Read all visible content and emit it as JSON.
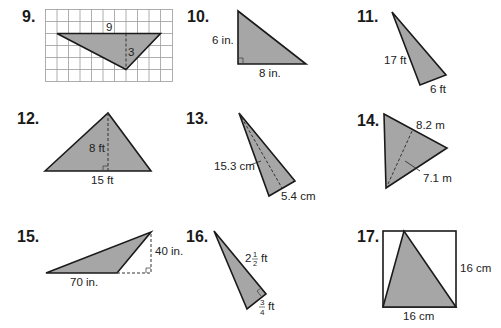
{
  "problems": [
    {
      "number": "9.",
      "labels": {
        "base": "9",
        "height": "3"
      },
      "figure": "triangle-on-grid"
    },
    {
      "number": "10.",
      "labels": {
        "height": "6 in.",
        "base": "8 in."
      },
      "figure": "right-triangle"
    },
    {
      "number": "11.",
      "labels": {
        "height": "17 ft",
        "base": "6 ft"
      },
      "figure": "right-triangle"
    },
    {
      "number": "12.",
      "labels": {
        "height": "8 ft",
        "base": "15 ft"
      },
      "figure": "triangle-with-altitude"
    },
    {
      "number": "13.",
      "labels": {
        "height": "15.3 cm",
        "base": "5.4 cm"
      },
      "figure": "triangle-with-altitude"
    },
    {
      "number": "14.",
      "labels": {
        "base": "8.2 m",
        "height": "7.1 m"
      },
      "figure": "triangle-with-altitude"
    },
    {
      "number": "15.",
      "labels": {
        "base": "70 in.",
        "height": "40 in."
      },
      "figure": "obtuse-triangle-external-altitude"
    },
    {
      "number": "16.",
      "labels": {
        "height_whole": "2",
        "height_num": "1",
        "height_den": "2",
        "height_unit": "ft",
        "base_num": "3",
        "base_den": "4",
        "base_unit": "ft"
      },
      "figure": "right-triangle"
    },
    {
      "number": "17.",
      "labels": {
        "height": "16 cm",
        "base": "16 cm"
      },
      "figure": "triangle-in-square"
    }
  ],
  "colors": {
    "fill": "#a6a6a6",
    "stroke": "#1a1a1a",
    "grid": "#9a9a9a",
    "dash": "#333333"
  }
}
